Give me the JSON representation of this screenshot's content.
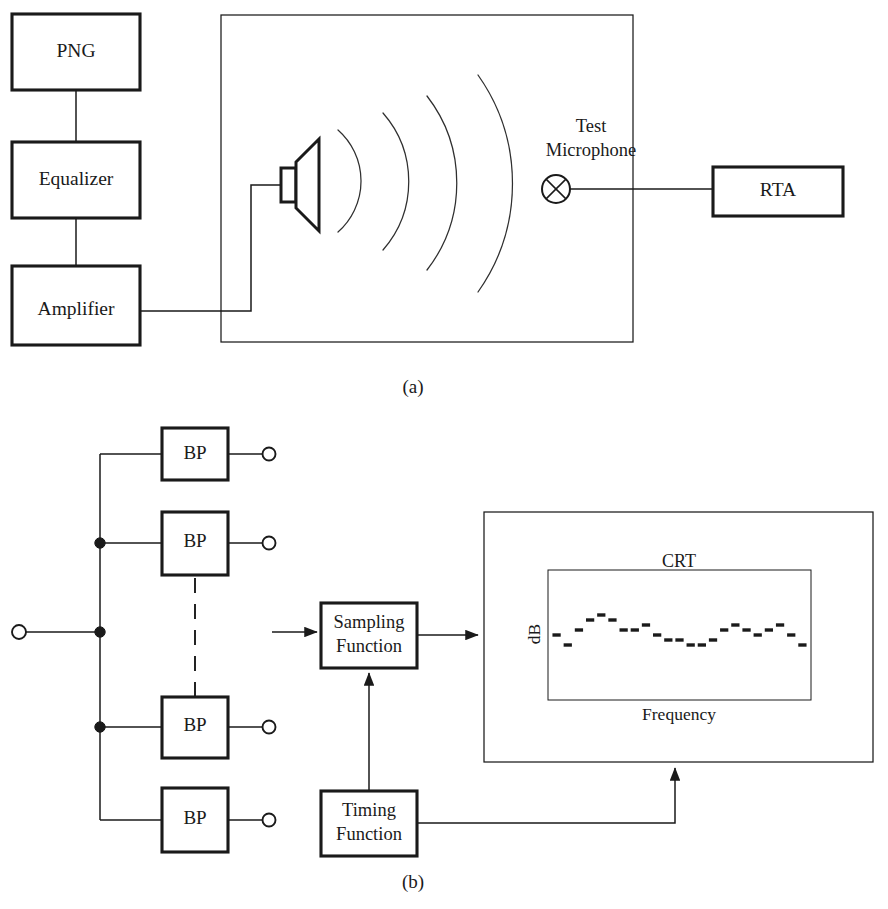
{
  "figure": {
    "panels": [
      {
        "id": "a",
        "caption": "(a)"
      },
      {
        "id": "b",
        "caption": "(b)"
      }
    ]
  },
  "panel_a": {
    "caption": "(a)",
    "source_chain": [
      {
        "label": "PNG"
      },
      {
        "label": "Equalizer"
      },
      {
        "label": "Amplifier"
      }
    ],
    "room": {
      "label": "",
      "speaker_name": "loudspeaker",
      "wavefront_count": 4
    },
    "microphone": {
      "label_line1": "Test",
      "label_line2": "Microphone"
    },
    "analyzer": {
      "label": "RTA"
    }
  },
  "panel_b": {
    "caption": "(b)",
    "input_terminal": "input-terminal",
    "filters": [
      {
        "label": "BP"
      },
      {
        "label": "BP"
      },
      {
        "label": "BP"
      },
      {
        "label": "BP"
      }
    ],
    "continuation": "vertical-dashed-ellipsis",
    "sampling": {
      "line1": "Sampling",
      "line2": "Function"
    },
    "timing": {
      "line1": "Timing",
      "line2": "Function"
    },
    "display": {
      "screen_label": "CRT",
      "y_axis_label": "dB",
      "x_axis_label": "Frequency"
    }
  },
  "chart_data": {
    "type": "bar",
    "title": "CRT",
    "xlabel": "Frequency",
    "ylabel": "dB",
    "grid": false,
    "legend": null,
    "note": "Spectrum displayed as short horizontal dash segments, one per band",
    "categories": [
      "1",
      "2",
      "3",
      "4",
      "5",
      "6",
      "7",
      "8",
      "9",
      "10",
      "11",
      "12",
      "13",
      "14",
      "15",
      "16",
      "17",
      "18",
      "19",
      "20",
      "21",
      "22",
      "23"
    ],
    "values": [
      0,
      -2,
      1,
      3,
      4,
      3,
      1,
      1,
      2,
      0,
      -1,
      -1,
      -2,
      -2,
      -1,
      1,
      2,
      1,
      0,
      1,
      2,
      0,
      -2
    ],
    "ylim": [
      -6,
      6
    ]
  }
}
